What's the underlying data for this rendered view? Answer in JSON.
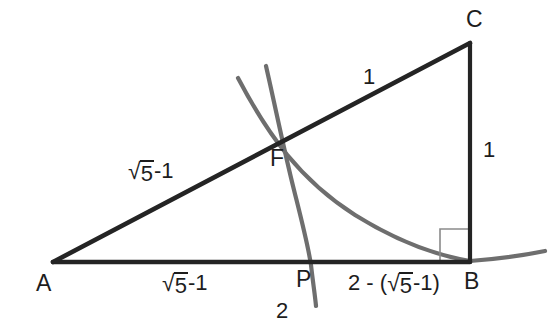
{
  "figure": {
    "type": "geometry-diagram",
    "width": 553,
    "height": 332,
    "background_color": "#ffffff",
    "line_color": "#242424",
    "arc_color": "#6e6e6e",
    "text_color": "#1d1d1d"
  },
  "points": [
    {
      "id": "A",
      "label": "A",
      "x": 53,
      "y": 262,
      "label_x": 36,
      "label_y": 272
    },
    {
      "id": "B",
      "label": "B",
      "x": 470,
      "y": 262,
      "label_x": 464,
      "label_y": 270
    },
    {
      "id": "C",
      "label": "C",
      "x": 470,
      "y": 43,
      "label_x": 466,
      "label_y": 8
    },
    {
      "id": "F",
      "label": "F",
      "x": 286,
      "y": 140,
      "label_x": 270,
      "label_y": 147
    },
    {
      "id": "P",
      "label": "P",
      "x": 311,
      "y": 262,
      "label_x": 296,
      "label_y": 268
    }
  ],
  "segments": [
    {
      "id": "AB",
      "from": "A",
      "to": "B",
      "style": "solid-black"
    },
    {
      "id": "AC",
      "from": "A",
      "to": "C",
      "style": "solid-black"
    },
    {
      "id": "BC",
      "from": "B",
      "to": "C",
      "style": "solid-black"
    }
  ],
  "right_angle": {
    "at": "B",
    "size": 30,
    "note": "right angle marker at vertex B"
  },
  "arcs": [
    {
      "id": "arc-F-to-B",
      "description": "arc centered at C through F meeting AB at B",
      "color": "#6e6e6e"
    },
    {
      "id": "arc-F-to-P",
      "description": "arc centered at A through F meeting AB at P",
      "color": "#6e6e6e"
    }
  ],
  "labels": {
    "upper_left_side": {
      "prefix": "",
      "surd": "√",
      "radicand": "5",
      "suffix": "-1",
      "text": "√5-1",
      "x": 128,
      "y": 160
    },
    "upper_right_side": {
      "text": "1",
      "x": 363,
      "y": 66
    },
    "vertical_side": {
      "text": "1",
      "x": 483,
      "y": 139
    },
    "base_left": {
      "prefix": "",
      "surd": "√",
      "radicand": "5",
      "suffix": "-1",
      "text": "√5-1",
      "x": 162,
      "y": 272
    },
    "base_right": {
      "prefix": "2 - (",
      "surd": "√",
      "radicand": "5",
      "suffix": "-1)",
      "text": "2 - (√5-1)",
      "x": 348,
      "y": 272
    },
    "arc_radius": {
      "text": "2",
      "x": 276,
      "y": 300
    }
  }
}
